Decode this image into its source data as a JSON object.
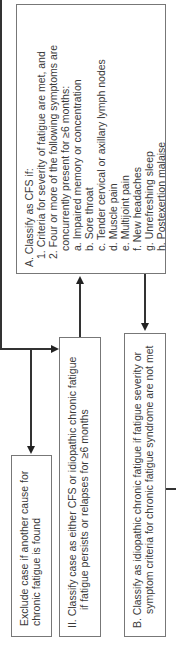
{
  "boxes": {
    "classify_cfs": {
      "title": "A. Classify as CFS if:",
      "criteria": [
        "1.  Criteria for severity of fatigue are met, and",
        "2.  Four or more of the following symptoms are",
        "     concurrently present for ≥6 months:"
      ],
      "symptoms": [
        "a. Impaired memory or concentration",
        "b. Sore throat",
        "c. Tender cervical or axillary lymph nodes",
        "d. Muscle pain",
        "e. Multijoint pain",
        "f.  New headaches",
        "g. Unrefreshing sleep",
        "h. Postexertion malaise"
      ]
    },
    "exclude": {
      "line1": "Exclude case if another cause for",
      "line2": "chronic fatigue is found"
    },
    "classify_either": {
      "line1": "II. Classify case as either CFS or idiopathic chronic fatigue",
      "line2": "if fatigue persists or relapses for ≥6 months"
    },
    "classify_idiopathic": {
      "line1": "B. Classify as idiopathic chronic fatigue if fatigue severity or",
      "line2": "symptom criteria for chronic fatigue syndrome are not met"
    }
  }
}
